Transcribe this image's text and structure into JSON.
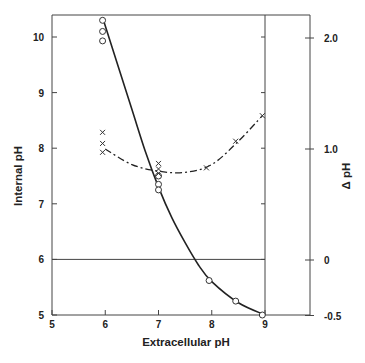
{
  "chart_data": {
    "type": "line",
    "title": "",
    "xlabel": "Extracellular pH",
    "ylabel": "Internal pH",
    "y2label": "Δ pH",
    "xlim": [
      5,
      9
    ],
    "ylim": [
      5,
      10.4
    ],
    "y2lim": [
      -0.5,
      2.2
    ],
    "x_ticks": [
      "5",
      "6",
      "7",
      "8",
      "9"
    ],
    "y_ticks": [
      "5",
      "6",
      "7",
      "8",
      "9",
      "10"
    ],
    "y2_ticks": [
      "-0.5",
      "0",
      "1.0",
      "2.0"
    ],
    "grid": false,
    "reference_lines": {
      "horizontal": {
        "internal_ph": 6,
        "delta_ph": 0
      },
      "vertical": {
        "extracellular_ph": 9
      }
    },
    "series": [
      {
        "name": "Internal pH",
        "axis": "left",
        "marker": "circle-open",
        "line_style": "solid",
        "points": [
          {
            "x": 5.95,
            "y": 10.3
          },
          {
            "x": 5.95,
            "y": 10.1
          },
          {
            "x": 5.95,
            "y": 9.93
          },
          {
            "x": 7.0,
            "y": 7.5
          },
          {
            "x": 7.0,
            "y": 7.35
          },
          {
            "x": 7.0,
            "y": 7.25
          },
          {
            "x": 7.95,
            "y": 5.62
          },
          {
            "x": 8.45,
            "y": 5.25
          },
          {
            "x": 8.95,
            "y": 5.0
          }
        ],
        "curve": [
          [
            5.95,
            10.35
          ],
          [
            6.2,
            9.6
          ],
          [
            6.5,
            8.7
          ],
          [
            6.75,
            7.95
          ],
          [
            7.0,
            7.3
          ],
          [
            7.25,
            6.75
          ],
          [
            7.5,
            6.3
          ],
          [
            7.75,
            5.9
          ],
          [
            8.0,
            5.6
          ],
          [
            8.5,
            5.22
          ],
          [
            9.0,
            5.0
          ]
        ]
      },
      {
        "name": "Δ pH",
        "axis": "right",
        "marker": "x",
        "line_style": "dash-dot",
        "points": [
          {
            "x": 5.95,
            "y": 1.15
          },
          {
            "x": 5.95,
            "y": 1.05
          },
          {
            "x": 5.95,
            "y": 0.97
          },
          {
            "x": 7.0,
            "y": 0.87
          },
          {
            "x": 7.0,
            "y": 0.82
          },
          {
            "x": 7.0,
            "y": 0.78
          },
          {
            "x": 7.9,
            "y": 0.83
          },
          {
            "x": 8.45,
            "y": 1.07
          },
          {
            "x": 8.95,
            "y": 1.3
          }
        ],
        "curve": [
          [
            6.0,
            1.0
          ],
          [
            6.5,
            0.86
          ],
          [
            7.0,
            0.8
          ],
          [
            7.5,
            0.79
          ],
          [
            8.0,
            0.86
          ],
          [
            8.5,
            1.07
          ],
          [
            8.95,
            1.3
          ]
        ]
      }
    ]
  }
}
